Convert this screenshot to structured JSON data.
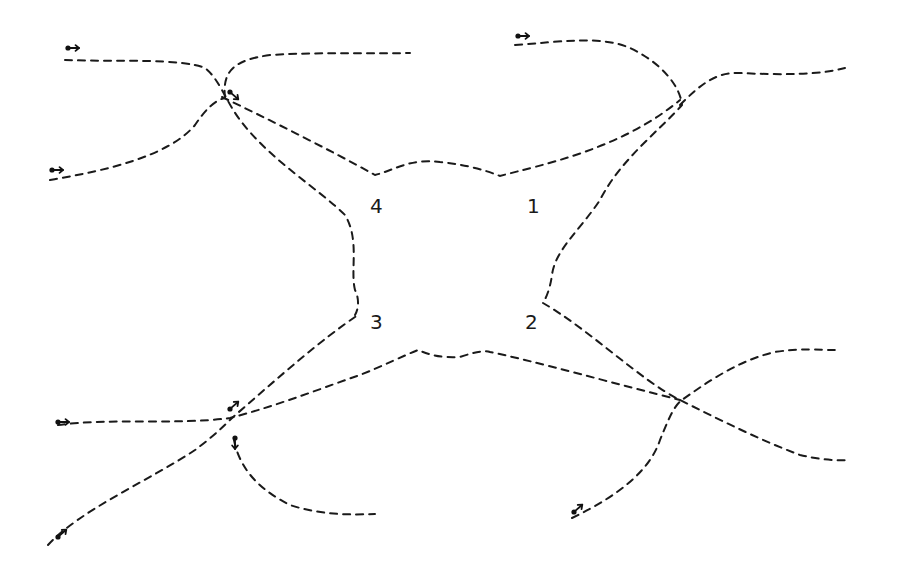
{
  "diagram": {
    "type": "hand-drawn trajectory diagram",
    "stroke_color": "#1a1a1a",
    "background_color": "#ffffff",
    "regions": [
      {
        "id": "region-4",
        "label": "4",
        "x": 370,
        "y": 196
      },
      {
        "id": "region-1",
        "label": "1",
        "x": 527,
        "y": 196
      },
      {
        "id": "region-3",
        "label": "3",
        "x": 370,
        "y": 312
      },
      {
        "id": "region-2",
        "label": "2",
        "x": 525,
        "y": 312
      }
    ],
    "paths": [
      {
        "name": "path-top-left-to-region-3",
        "d": "M65,60 C120,62 180,58 205,68 C220,80 225,100 240,120 C270,160 320,190 345,215 C360,240 350,270 355,290 C360,300 358,310 355,315"
      },
      {
        "name": "path-left-to-top",
        "d": "M50,180 C110,170 170,155 195,125 C205,110 215,100 225,98 M225,98 C222,70 235,60 270,55 C320,52 360,54 410,53"
      },
      {
        "name": "path-crossing-to-top-right",
        "d": "M222,97 C270,120 330,150 375,175 C395,170 410,158 440,162 C470,165 490,172 500,176 C540,165 620,150 680,100"
      },
      {
        "name": "path-top-right-loop",
        "d": "M515,45 C560,42 600,35 630,48 C660,62 680,85 682,105 C660,130 620,160 600,200 C580,230 555,250 552,275 C550,290 545,300 543,303"
      },
      {
        "name": "path-right-top-exit",
        "d": "M680,105 C700,85 715,72 740,73 C780,75 820,75 845,68"
      },
      {
        "name": "path-region-2-to-right",
        "d": "M543,303 C590,330 640,380 680,400 C720,420 760,440 800,455 C830,462 845,460 848,460"
      },
      {
        "name": "path-bottom-left-across",
        "d": "M58,425 C110,418 180,425 230,418 C280,405 330,385 360,375 C385,365 405,355 418,350 C430,355 440,358 460,357 C475,352 485,350 490,352 C530,360 620,385 680,400"
      },
      {
        "name": "path-bottom-left-diagonal",
        "d": "M48,545 C80,510 150,480 195,450 C215,435 225,425 232,418 C270,385 320,340 358,315"
      },
      {
        "name": "path-crossing-down-right",
        "d": "M234,440 C240,470 260,490 290,505 C320,515 350,515 375,514"
      },
      {
        "name": "path-bottom-right-up",
        "d": "M572,518 C620,495 650,470 660,440 C670,415 675,405 682,400 C710,380 740,360 775,352 C800,348 820,350 835,350"
      }
    ],
    "start_markers": [
      {
        "name": "start-marker-top-left",
        "x": 68,
        "y": 48,
        "direction": "right"
      },
      {
        "name": "start-marker-left",
        "x": 52,
        "y": 170,
        "direction": "right"
      },
      {
        "name": "start-marker-crossing-top-left",
        "x": 230,
        "y": 92,
        "direction": "down-right"
      },
      {
        "name": "start-marker-top-right",
        "x": 518,
        "y": 36,
        "direction": "right"
      },
      {
        "name": "start-marker-bottom-left-horizontal",
        "x": 58,
        "y": 422,
        "direction": "right"
      },
      {
        "name": "start-marker-crossing-bottom-left-up",
        "x": 230,
        "y": 409,
        "direction": "up-right"
      },
      {
        "name": "start-marker-crossing-bottom-left-down",
        "x": 235,
        "y": 438,
        "direction": "down"
      },
      {
        "name": "start-marker-bottom-left-diagonal",
        "x": 58,
        "y": 537,
        "direction": "up-right"
      },
      {
        "name": "start-marker-bottom-right",
        "x": 574,
        "y": 512,
        "direction": "up-right"
      }
    ]
  }
}
